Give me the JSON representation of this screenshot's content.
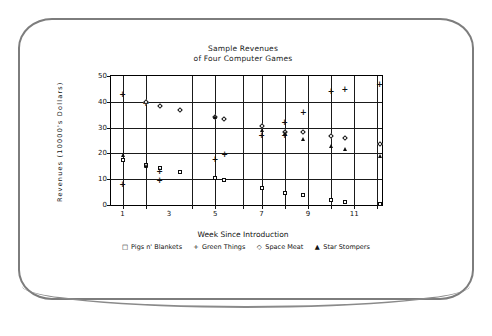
{
  "chart_data": {
    "type": "scatter",
    "title": "Sample Revenues",
    "title_line2": "of Four Computer Games",
    "xlabel": "Week Since Introduction",
    "ylabel": "Revenues (10000's Dollars)",
    "xlim": [
      0.5,
      12.2
    ],
    "ylim": [
      0,
      50
    ],
    "xticks": [
      1,
      3,
      5,
      7,
      9,
      11
    ],
    "xtick_labels": [
      "1",
      "3",
      "5",
      "7",
      "9",
      "11"
    ],
    "yticks": [
      0,
      10,
      20,
      30,
      40,
      50
    ],
    "ytick_labels": [
      "0",
      "10",
      "20",
      "30",
      "40",
      "50"
    ],
    "grid": true,
    "grid_x": [
      1,
      2,
      4,
      5,
      6.2,
      7,
      8,
      9,
      10,
      11,
      12
    ],
    "legend_position": "below",
    "series": [
      {
        "name": "Pigs n' Blankets",
        "marker": "square",
        "points": [
          {
            "x": 1.0,
            "y": 17.5
          },
          {
            "x": 2.0,
            "y": 15.5
          },
          {
            "x": 2.6,
            "y": 14.3
          },
          {
            "x": 3.5,
            "y": 12.6
          },
          {
            "x": 5.0,
            "y": 10.3
          },
          {
            "x": 5.4,
            "y": 9.6
          },
          {
            "x": 7.0,
            "y": 6.4
          },
          {
            "x": 8.0,
            "y": 4.8
          },
          {
            "x": 8.8,
            "y": 3.8
          },
          {
            "x": 10.0,
            "y": 1.8
          },
          {
            "x": 10.6,
            "y": 1.2
          },
          {
            "x": 12.1,
            "y": 0.2
          }
        ]
      },
      {
        "name": "Green Things",
        "marker": "plus",
        "points": [
          {
            "x": 1.0,
            "y": 43.0
          },
          {
            "x": 1.0,
            "y": 8.0
          },
          {
            "x": 2.0,
            "y": 39.5
          },
          {
            "x": 2.6,
            "y": 9.8
          },
          {
            "x": 2.6,
            "y": 13.0
          },
          {
            "x": 5.0,
            "y": 18.0
          },
          {
            "x": 5.4,
            "y": 19.6
          },
          {
            "x": 7.0,
            "y": 27.3
          },
          {
            "x": 8.0,
            "y": 32.0
          },
          {
            "x": 8.0,
            "y": 27.0
          },
          {
            "x": 8.8,
            "y": 36.0
          },
          {
            "x": 10.0,
            "y": 44.0
          },
          {
            "x": 10.6,
            "y": 44.8
          },
          {
            "x": 12.1,
            "y": 47.0
          }
        ]
      },
      {
        "name": "Space Meat",
        "marker": "diamond",
        "points": [
          {
            "x": 2.0,
            "y": 40.0
          },
          {
            "x": 2.6,
            "y": 38.5
          },
          {
            "x": 3.5,
            "y": 36.8
          },
          {
            "x": 5.0,
            "y": 34.0
          },
          {
            "x": 5.4,
            "y": 33.3
          },
          {
            "x": 7.0,
            "y": 30.6
          },
          {
            "x": 8.0,
            "y": 28.3
          },
          {
            "x": 8.8,
            "y": 28.3
          },
          {
            "x": 10.0,
            "y": 26.6
          },
          {
            "x": 10.6,
            "y": 25.8
          },
          {
            "x": 12.1,
            "y": 23.5
          }
        ]
      },
      {
        "name": "Star Stompers",
        "marker": "triangle",
        "points": [
          {
            "x": 1.0,
            "y": 19.3
          },
          {
            "x": 2.0,
            "y": 15.3
          },
          {
            "x": 5.0,
            "y": 34.0
          },
          {
            "x": 7.0,
            "y": 29.0
          },
          {
            "x": 8.0,
            "y": 27.8
          },
          {
            "x": 8.8,
            "y": 25.7
          },
          {
            "x": 10.0,
            "y": 22.7
          },
          {
            "x": 10.6,
            "y": 21.8
          },
          {
            "x": 12.1,
            "y": 19.0
          }
        ]
      }
    ]
  },
  "legend": {
    "entries": [
      {
        "glyph": "□",
        "label": "Pigs n' Blankets"
      },
      {
        "glyph": "+",
        "label": "Green Things"
      },
      {
        "glyph": "◇",
        "label": "Space Meat"
      },
      {
        "glyph": "▲",
        "label": "Star Stompers"
      }
    ]
  },
  "colors": {
    "ink": "#0d0d0d",
    "bezel": "#7d7d7d",
    "background": "#ffffff"
  }
}
